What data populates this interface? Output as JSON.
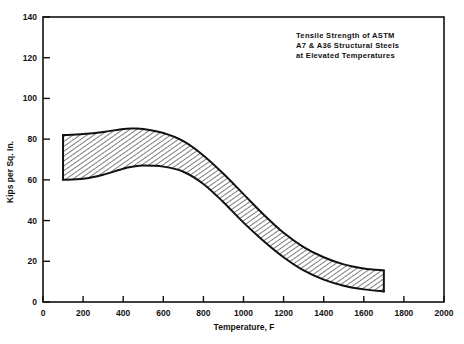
{
  "chart_data": {
    "type": "area",
    "title": "Tensile Strength of ASTM A7 & A36 Structural Steels at Elevated Temperatures",
    "title_lines": [
      "Tensile Strength of ASTM",
      "A7 & A36 Structural Steels",
      "at Elevated Temperatures"
    ],
    "xlabel": "Temperature, F",
    "ylabel": "Kips per Sq. In.",
    "xlim": [
      0,
      2000
    ],
    "ylim": [
      0,
      140
    ],
    "xticks": [
      0,
      200,
      400,
      600,
      800,
      1000,
      1200,
      1400,
      1600,
      1800,
      2000
    ],
    "xticklabels": [
      "0",
      "200",
      "400",
      "600",
      "800",
      "1000",
      "1200",
      "1400",
      "1600",
      "1800",
      "2000"
    ],
    "yticks": [
      0,
      20,
      40,
      60,
      80,
      100,
      120,
      140
    ],
    "yticklabels": [
      "0",
      "20",
      "40",
      "60",
      "80",
      "100",
      "120",
      "140"
    ],
    "grid": false,
    "legend": false,
    "band_fill": "hatch-diagonal",
    "line_color": "#111111",
    "x": [
      100,
      200,
      300,
      400,
      450,
      500,
      600,
      700,
      800,
      900,
      1000,
      1100,
      1200,
      1300,
      1400,
      1500,
      1600,
      1700
    ],
    "series": [
      {
        "name": "Upper bound tensile strength",
        "values": [
          82,
          82.5,
          83.5,
          85,
          85.2,
          85,
          83,
          79,
          72,
          63,
          53,
          43,
          34,
          27,
          22,
          18.5,
          16.5,
          15.5
        ]
      },
      {
        "name": "Lower bound tensile strength",
        "values": [
          60,
          60.5,
          62.5,
          65.5,
          66.5,
          67,
          66.5,
          64,
          58,
          49,
          39,
          30,
          22,
          15.5,
          11,
          8,
          6.2,
          5.2
        ]
      }
    ]
  },
  "axis": {
    "x_title": "Temperature, F",
    "y_title": "Kips per Sq. In."
  }
}
